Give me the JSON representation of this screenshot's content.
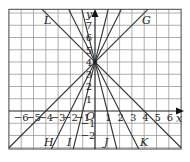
{
  "diagram": {
    "type": "coordinate-graph",
    "axes": {
      "x_label": "x",
      "y_label": "y",
      "origin_label": "O",
      "x_ticks": [
        "−6",
        "−5",
        "−4",
        "−3",
        "−2",
        "−1",
        "1",
        "2",
        "3",
        "4",
        "5",
        "6"
      ],
      "y_ticks": [
        "1",
        "2",
        "3",
        "4",
        "5",
        "6",
        "7",
        "−1",
        "−2"
      ]
    },
    "lines": [
      {
        "label": "G",
        "equation": "y = x + 4",
        "slope": 1,
        "intercept": 4
      },
      {
        "label": "H",
        "equation": "y = 2x + 4",
        "slope": 2,
        "intercept": 4
      },
      {
        "label": "I",
        "equation": "y = 4x + 4",
        "slope": 4,
        "intercept": 4
      },
      {
        "label": "J",
        "equation": "y = −4x + 4",
        "slope": -4,
        "intercept": 4
      },
      {
        "label": "K",
        "equation": "y = −2x + 4",
        "slope": -2,
        "intercept": 4
      },
      {
        "label": "L",
        "equation": "y = −x + 4",
        "slope": -1,
        "intercept": 4
      }
    ],
    "common_point": "(0, 4)",
    "x_range": [
      -7,
      7
    ],
    "y_range": [
      -3,
      8
    ]
  }
}
